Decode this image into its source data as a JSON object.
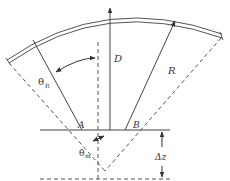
{
  "diagram": {
    "type": "geometry-schematic",
    "colors": {
      "stroke": "#444444",
      "background": "#ffffff"
    },
    "labels": {
      "D": "D",
      "R": "R",
      "A": "A",
      "B": "B",
      "theta_R": {
        "symbol": "θ",
        "subscript": "R"
      },
      "theta_m": {
        "symbol": "θ",
        "subscript": "m"
      },
      "delta_z": "Δz"
    }
  }
}
